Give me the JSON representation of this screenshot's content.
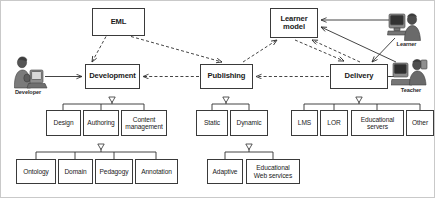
{
  "diagram": {
    "type": "block-diagram",
    "stroke_color": "#3a3a3a",
    "frame_color": "#c9c9c9",
    "background": "#ffffff"
  },
  "nodes": {
    "eml": {
      "label": "EML",
      "x": 92,
      "y": 8,
      "w": 53,
      "h": 28
    },
    "learner_model": {
      "label": "Learner\nmodel",
      "x": 270,
      "y": 8,
      "w": 48,
      "h": 30
    },
    "development": {
      "label": "Development",
      "x": 85,
      "y": 64,
      "w": 55,
      "h": 25
    },
    "publishing": {
      "label": "Publishing",
      "x": 200,
      "y": 64,
      "w": 53,
      "h": 25
    },
    "delivery": {
      "label": "Delivery",
      "x": 330,
      "y": 64,
      "w": 58,
      "h": 25
    },
    "design": {
      "label": "Design",
      "x": 46,
      "y": 110,
      "w": 35,
      "h": 26
    },
    "authoring": {
      "label": "Authoring",
      "x": 83,
      "y": 110,
      "w": 36,
      "h": 26
    },
    "content_management": {
      "label": "Content\nmanagement",
      "x": 121,
      "y": 110,
      "w": 46,
      "h": 26
    },
    "ontology": {
      "label": "Ontology",
      "x": 16,
      "y": 159,
      "w": 40,
      "h": 25
    },
    "domain": {
      "label": "Domain",
      "x": 58,
      "y": 159,
      "w": 35,
      "h": 25
    },
    "pedagogy": {
      "label": "Pedagogy",
      "x": 95,
      "y": 159,
      "w": 38,
      "h": 25
    },
    "annotation": {
      "label": "Annotation",
      "x": 135,
      "y": 159,
      "w": 43,
      "h": 25
    },
    "static": {
      "label": "Static",
      "x": 196,
      "y": 110,
      "w": 32,
      "h": 26
    },
    "dynamic": {
      "label": "Dynamic",
      "x": 230,
      "y": 110,
      "w": 38,
      "h": 26
    },
    "adaptive": {
      "label": "Adaptive",
      "x": 207,
      "y": 159,
      "w": 36,
      "h": 25
    },
    "educational_web_services": {
      "label": "Educational\nWeb services",
      "x": 246,
      "y": 159,
      "w": 54,
      "h": 25
    },
    "lms": {
      "label": "LMS",
      "x": 291,
      "y": 110,
      "w": 27,
      "h": 26
    },
    "lor": {
      "label": "LOR",
      "x": 320,
      "y": 110,
      "w": 28,
      "h": 26
    },
    "educational_servers": {
      "label": "Educational\nservers",
      "x": 351,
      "y": 110,
      "w": 53,
      "h": 26
    },
    "other": {
      "label": "Other",
      "x": 406,
      "y": 110,
      "w": 28,
      "h": 26
    }
  },
  "actors": [
    {
      "id": "developer",
      "label": "Developer",
      "x": 6,
      "y": 55,
      "w": 44,
      "h": 34
    },
    {
      "id": "learner",
      "label": "Learner",
      "x": 387,
      "y": 10,
      "w": 39,
      "h": 31
    },
    {
      "id": "teacher",
      "label": "Teacher",
      "x": 391,
      "y": 56,
      "w": 40,
      "h": 31
    }
  ],
  "edges": [
    {
      "from": "eml",
      "to": "development",
      "style": "dashed",
      "arrow": "open"
    },
    {
      "from": "eml",
      "to": "publishing",
      "style": "dashed",
      "arrow": "open"
    },
    {
      "from": "publishing",
      "to": "development",
      "style": "dashed",
      "arrow": "open"
    },
    {
      "from": "delivery",
      "to": "publishing",
      "style": "dashed",
      "arrow": "open"
    },
    {
      "from": "publishing",
      "to": "learner_model",
      "style": "dashed",
      "arrow": "open"
    },
    {
      "from": "learner_model",
      "to": "delivery",
      "style": "dashed",
      "arrow": "open"
    },
    {
      "from": "delivery",
      "to": "learner_model",
      "style": "dashed",
      "arrow": "open"
    },
    {
      "from": "developer",
      "to": "development",
      "style": "solid",
      "arrow": "open"
    },
    {
      "from": "learner",
      "to": "learner_model",
      "style": "solid",
      "arrow": "open"
    },
    {
      "from": "learner",
      "to": "delivery",
      "style": "solid",
      "arrow": "open"
    },
    {
      "from": "teacher",
      "to": "learner_model",
      "style": "solid",
      "arrow": "open"
    },
    {
      "from": "teacher",
      "to": "delivery",
      "style": "solid",
      "arrow": "none"
    },
    {
      "from": "development",
      "to": [
        "design",
        "authoring",
        "content_management"
      ],
      "style": "solid",
      "arrow": "hollow-triangle"
    },
    {
      "from": "authoring",
      "to": [
        "ontology",
        "domain",
        "pedagogy",
        "annotation"
      ],
      "style": "solid",
      "arrow": "hollow-triangle"
    },
    {
      "from": "publishing",
      "to": [
        "static",
        "dynamic"
      ],
      "style": "solid",
      "arrow": "hollow-triangle"
    },
    {
      "from": "dynamic",
      "to": [
        "adaptive",
        "educational_web_services"
      ],
      "style": "solid",
      "arrow": "hollow-triangle"
    },
    {
      "from": "delivery",
      "to": [
        "lms",
        "lor",
        "educational_servers",
        "other"
      ],
      "style": "solid",
      "arrow": "hollow-triangle"
    }
  ]
}
